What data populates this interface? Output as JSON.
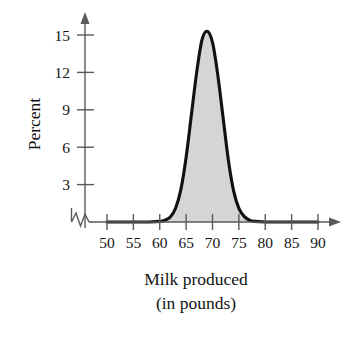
{
  "chart_data": {
    "type": "area",
    "title": "",
    "xlabel": "Milk produced",
    "xlabel_line2": "(in pounds)",
    "ylabel": "Percent",
    "xlim": [
      48,
      93
    ],
    "ylim": [
      0,
      17
    ],
    "x_ticks": [
      "50",
      "55",
      "60",
      "65",
      "70",
      "75",
      "80",
      "85",
      "90"
    ],
    "x_tick_values": [
      50,
      55,
      60,
      65,
      70,
      75,
      80,
      85,
      90
    ],
    "y_ticks": [
      "3",
      "6",
      "9",
      "12",
      "15"
    ],
    "y_tick_values": [
      3,
      6,
      9,
      12,
      15
    ],
    "grid": false,
    "legend": false,
    "axis_break": true,
    "axis_break_note": "zigzag break on x-axis between origin and 50",
    "curve_color": "#111111",
    "fill_color": "#d5d5d5",
    "axis_color": "#5a5a5a",
    "peak_x": 69,
    "peak_y": 15.3,
    "series": [
      {
        "name": "Milk produced distribution",
        "x": [
          50,
          52,
          54,
          56,
          58,
          60,
          61,
          62,
          63,
          64,
          65,
          66,
          67,
          68,
          69,
          70,
          71,
          72,
          73,
          74,
          75,
          76,
          77,
          78,
          80,
          82,
          85,
          88,
          90
        ],
        "values": [
          0,
          0,
          0,
          0,
          0,
          0.05,
          0.15,
          0.4,
          1.1,
          2.6,
          5.2,
          8.6,
          12.0,
          14.6,
          15.3,
          14.4,
          11.8,
          8.4,
          5.0,
          2.5,
          1.1,
          0.45,
          0.15,
          0.05,
          0,
          0,
          0,
          0,
          0
        ]
      }
    ]
  },
  "labels": {
    "ylabel": "Percent",
    "xlabel": "Milk produced",
    "xlabel_line2": "(in pounds)",
    "x0": "50",
    "x1": "55",
    "x2": "60",
    "x3": "65",
    "x4": "70",
    "x5": "75",
    "x6": "80",
    "x7": "85",
    "x8": "90",
    "y0": "3",
    "y1": "6",
    "y2": "9",
    "y3": "12",
    "y4": "15"
  }
}
